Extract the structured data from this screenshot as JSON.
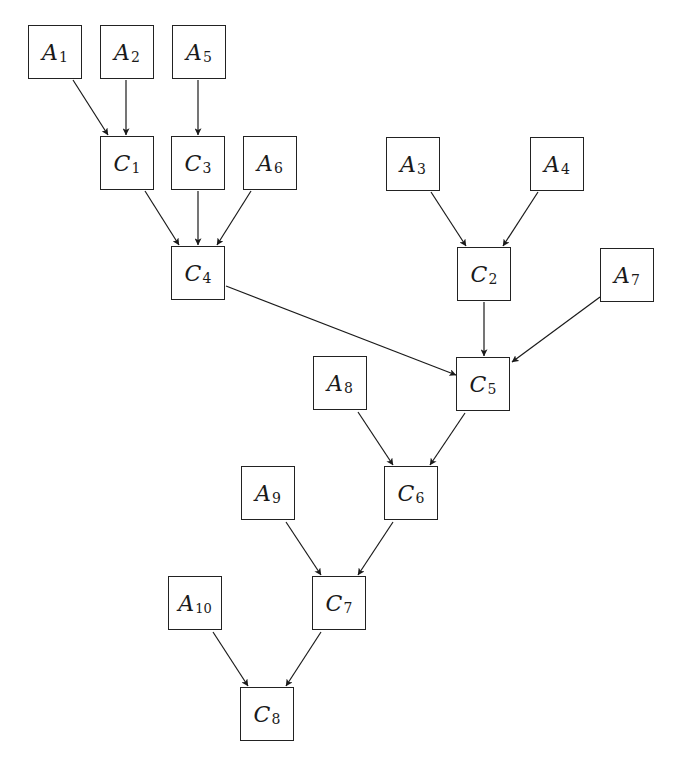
{
  "diagram": {
    "node_size": 54,
    "nodes": [
      {
        "id": "A1",
        "letter": "A",
        "sub": "1",
        "x": 28,
        "y": 25
      },
      {
        "id": "A2",
        "letter": "A",
        "sub": "2",
        "x": 100,
        "y": 25
      },
      {
        "id": "A5",
        "letter": "A",
        "sub": "5",
        "x": 172,
        "y": 25
      },
      {
        "id": "C1",
        "letter": "C",
        "sub": "1",
        "x": 100,
        "y": 136
      },
      {
        "id": "C3",
        "letter": "C",
        "sub": "3",
        "x": 171,
        "y": 136
      },
      {
        "id": "A6",
        "letter": "A",
        "sub": "6",
        "x": 243,
        "y": 136
      },
      {
        "id": "A3",
        "letter": "A",
        "sub": "3",
        "x": 386,
        "y": 137
      },
      {
        "id": "A4",
        "letter": "A",
        "sub": "4",
        "x": 530,
        "y": 137
      },
      {
        "id": "C4",
        "letter": "C",
        "sub": "4",
        "x": 171,
        "y": 246
      },
      {
        "id": "C2",
        "letter": "C",
        "sub": "2",
        "x": 457,
        "y": 247
      },
      {
        "id": "A7",
        "letter": "A",
        "sub": "7",
        "x": 600,
        "y": 248
      },
      {
        "id": "A8",
        "letter": "A",
        "sub": "8",
        "x": 313,
        "y": 356
      },
      {
        "id": "C5",
        "letter": "C",
        "sub": "5",
        "x": 456,
        "y": 357
      },
      {
        "id": "A9",
        "letter": "A",
        "sub": "9",
        "x": 241,
        "y": 466
      },
      {
        "id": "C6",
        "letter": "C",
        "sub": "6",
        "x": 384,
        "y": 466
      },
      {
        "id": "A10",
        "letter": "A",
        "sub": "10",
        "x": 168,
        "y": 576
      },
      {
        "id": "C7",
        "letter": "C",
        "sub": "7",
        "x": 312,
        "y": 576
      },
      {
        "id": "C8",
        "letter": "C",
        "sub": "8",
        "x": 240,
        "y": 687
      }
    ],
    "edges": [
      {
        "from": "A1",
        "to": "C1",
        "x1": 73,
        "y1": 80,
        "x2": 108,
        "y2": 135
      },
      {
        "from": "A2",
        "to": "C1",
        "x1": 126,
        "y1": 80,
        "x2": 126,
        "y2": 135
      },
      {
        "from": "A5",
        "to": "C3",
        "x1": 198,
        "y1": 80,
        "x2": 198,
        "y2": 135
      },
      {
        "from": "C1",
        "to": "C4",
        "x1": 145,
        "y1": 191,
        "x2": 179,
        "y2": 245
      },
      {
        "from": "C3",
        "to": "C4",
        "x1": 198,
        "y1": 191,
        "x2": 198,
        "y2": 245
      },
      {
        "from": "A6",
        "to": "C4",
        "x1": 251,
        "y1": 191,
        "x2": 217,
        "y2": 245
      },
      {
        "from": "A3",
        "to": "C2",
        "x1": 431,
        "y1": 192,
        "x2": 466,
        "y2": 246
      },
      {
        "from": "A4",
        "to": "C2",
        "x1": 538,
        "y1": 192,
        "x2": 503,
        "y2": 246
      },
      {
        "from": "C4",
        "to": "C5",
        "x1": 226,
        "y1": 286,
        "x2": 456,
        "y2": 375
      },
      {
        "from": "C2",
        "to": "C5",
        "x1": 484,
        "y1": 302,
        "x2": 484,
        "y2": 356
      },
      {
        "from": "A7",
        "to": "C5",
        "x1": 600,
        "y1": 297,
        "x2": 512,
        "y2": 362
      },
      {
        "from": "A8",
        "to": "C6",
        "x1": 358,
        "y1": 412,
        "x2": 393,
        "y2": 465
      },
      {
        "from": "C5",
        "to": "C6",
        "x1": 465,
        "y1": 413,
        "x2": 430,
        "y2": 465
      },
      {
        "from": "A9",
        "to": "C7",
        "x1": 286,
        "y1": 522,
        "x2": 321,
        "y2": 575
      },
      {
        "from": "C6",
        "to": "C7",
        "x1": 393,
        "y1": 522,
        "x2": 358,
        "y2": 575
      },
      {
        "from": "A10",
        "to": "C8",
        "x1": 213,
        "y1": 632,
        "x2": 248,
        "y2": 686
      },
      {
        "from": "C7",
        "to": "C8",
        "x1": 321,
        "y1": 632,
        "x2": 286,
        "y2": 686
      }
    ]
  }
}
